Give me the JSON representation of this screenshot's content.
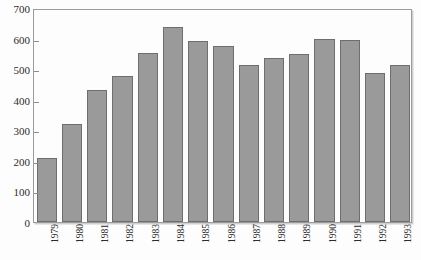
{
  "chart_data": {
    "type": "bar",
    "title": "",
    "subtitle": "",
    "xlabel": "",
    "ylabel": "",
    "categories": [
      "1979",
      "1980",
      "1981",
      "1982",
      "1983",
      "1984",
      "1985",
      "1986",
      "1987",
      "1988",
      "1989",
      "1990",
      "1991",
      "1992",
      "1993"
    ],
    "values": [
      208,
      320,
      433,
      478,
      553,
      638,
      592,
      577,
      515,
      538,
      550,
      600,
      597,
      488,
      512
    ],
    "series": [
      {
        "name": "",
        "values": [
          208,
          320,
          433,
          478,
          553,
          638,
          592,
          577,
          515,
          538,
          550,
          600,
          597,
          488,
          512
        ]
      }
    ],
    "ylim": [
      0,
      700
    ],
    "yticks": [
      0,
      100,
      200,
      300,
      400,
      500,
      600,
      700
    ],
    "ytick_labels": [
      "0",
      "100",
      "200",
      "300",
      "400",
      "500",
      "600",
      "700"
    ],
    "grid": false,
    "legend": false,
    "legend_position": "none",
    "bar_color": "#9a9a9a",
    "bar_edge_color": "#6e6e6e",
    "frame_color": "#9b9b9b",
    "background_color": "#fdfdfd",
    "text_color": "#2b2b2b",
    "xtick_label_rotation": 90
  }
}
